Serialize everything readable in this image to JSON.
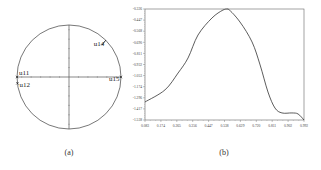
{
  "captions": {
    "a": "(a)",
    "b": "(b)"
  },
  "chart_data": [
    {
      "type": "scatter",
      "title": "",
      "subplot": "(a)",
      "description": "Unit circle with cross axes and labeled points",
      "circle": {
        "cx": 69,
        "cy": 77,
        "r": 52
      },
      "points": [
        {
          "label": "u11",
          "angle_deg": 180,
          "marker": "x"
        },
        {
          "label": "u12",
          "angle_deg": 187,
          "marker": "x"
        },
        {
          "label": "u14",
          "angle_deg": 45,
          "marker": "arrow"
        },
        {
          "label": "u15",
          "angle_deg": 0,
          "marker": "x"
        }
      ],
      "xlabel": "",
      "ylabel": "",
      "grid": false
    },
    {
      "type": "line",
      "title": "",
      "subplot": "(b)",
      "xlabel": "",
      "ylabel": "",
      "xlim": [
        0.083,
        0.992
      ],
      "ylim": [
        -1.538,
        -0.326
      ],
      "x_ticks": [
        "0.083",
        "0.174",
        "0.265",
        "0.356",
        "0.447",
        "0.538",
        "0.629",
        "0.720",
        "0.811",
        "0.902",
        "0.992"
      ],
      "y_ticks": [
        "-0.326",
        "-0.447",
        "-0.568",
        "-0.690",
        "-0.811",
        "-0.932",
        "-1.053",
        "-1.174",
        "-1.296",
        "-1.417",
        "-1.538"
      ],
      "grid": false,
      "legend": null,
      "series": [
        {
          "name": "curve",
          "x": [
            0.083,
            0.197,
            0.272,
            0.329,
            0.386,
            0.466,
            0.529,
            0.558,
            0.626,
            0.695,
            0.741,
            0.786,
            0.826,
            0.866,
            0.923,
            0.958,
            0.992
          ],
          "y": [
            -1.341,
            -1.21,
            -1.025,
            -0.861,
            -0.61,
            -0.424,
            -0.337,
            -0.326,
            -0.468,
            -0.686,
            -0.937,
            -1.232,
            -1.407,
            -1.461,
            -1.461,
            -1.472,
            -1.538
          ]
        }
      ]
    }
  ]
}
